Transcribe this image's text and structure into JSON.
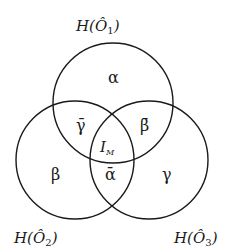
{
  "diagram": {
    "type": "venn-3",
    "stroke_color": "#1a1a1a",
    "background": "#ffffff",
    "sets": [
      {
        "id": "O1",
        "label_prefix": "H(",
        "label_var": "Ô",
        "label_sub": "1",
        "label_suffix": ")",
        "cx": 113,
        "cy": 103,
        "r": 60
      },
      {
        "id": "O2",
        "label_prefix": "H(",
        "label_var": "Ô",
        "label_sub": "2",
        "label_suffix": ")",
        "cx": 75,
        "cy": 160,
        "r": 59
      },
      {
        "id": "O3",
        "label_prefix": "H(",
        "label_var": "Ô",
        "label_sub": "3",
        "label_suffix": ")",
        "cx": 149,
        "cy": 160,
        "r": 59
      }
    ],
    "regions": {
      "only_O1": "α",
      "only_O2": "β",
      "only_O3": "γ",
      "O1_O2_only": "γ̄",
      "O1_O3_only": "β̄",
      "O2_O3_only": "ᾱ",
      "center_main": "I",
      "center_sub": "M"
    }
  }
}
